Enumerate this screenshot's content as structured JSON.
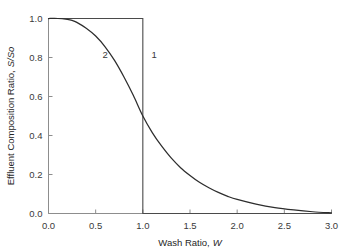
{
  "chart_data": {
    "type": "line",
    "title": "",
    "xlabel": "Wash Ratio, W",
    "xlabel_plain": "Wash Ratio,",
    "xlabel_italic": "W",
    "ylabel": "Effluent Composition Ratio, S/So",
    "ylabel_plain": "Effluent Composition Ratio,",
    "ylabel_italic": "S/So",
    "xlim": [
      0.0,
      3.0
    ],
    "ylim": [
      0.0,
      1.0
    ],
    "xticks": [
      0.0,
      0.5,
      1.0,
      1.5,
      2.0,
      2.5,
      3.0
    ],
    "xticklabels": [
      "0.0",
      "0.5",
      "1.0",
      "1.5",
      "2.0",
      "2.5",
      "3.0"
    ],
    "yticks": [
      0.0,
      0.2,
      0.4,
      0.6,
      0.8,
      1.0
    ],
    "yticklabels": [
      "0.0",
      "0.2",
      "0.4",
      "0.6",
      "0.8",
      "1.0"
    ],
    "grid": false,
    "legend": "none",
    "curve_colors": {
      "curve1": "#4a4a4a",
      "curve2": "#2d2d2d",
      "axis": "#8d8d8d",
      "background": "#ffffff"
    },
    "annotations": [
      {
        "label": "1",
        "x": 1.12,
        "y": 0.8,
        "describes": "ideal-plug-flow-step"
      },
      {
        "label": "2",
        "x": 0.6,
        "y": 0.8,
        "describes": "actual-dispersed-washing-curve"
      }
    ],
    "series": [
      {
        "name": "1",
        "description": "Ideal displacement (plug flow) step function",
        "x": [
          0.0,
          0.25,
          0.5,
          0.75,
          1.0,
          1.0,
          1.25,
          1.5,
          2.0,
          2.5,
          3.0
        ],
        "values": [
          1.0,
          1.0,
          1.0,
          1.0,
          1.0,
          0.0,
          0.0,
          0.0,
          0.0,
          0.0,
          0.0
        ]
      },
      {
        "name": "2",
        "description": "Actual washing curve with axial dispersion",
        "x": [
          0.0,
          0.1,
          0.2,
          0.25,
          0.3,
          0.4,
          0.5,
          0.6,
          0.7,
          0.8,
          0.9,
          1.0,
          1.1,
          1.2,
          1.3,
          1.4,
          1.5,
          1.6,
          1.7,
          1.8,
          1.9,
          2.0,
          2.2,
          2.4,
          2.6,
          2.8,
          3.0
        ],
        "values": [
          1.0,
          1.0,
          0.995,
          0.99,
          0.98,
          0.95,
          0.91,
          0.855,
          0.785,
          0.7,
          0.605,
          0.5,
          0.415,
          0.345,
          0.285,
          0.235,
          0.195,
          0.16,
          0.132,
          0.108,
          0.088,
          0.072,
          0.048,
          0.03,
          0.018,
          0.009,
          0.003
        ]
      }
    ]
  }
}
